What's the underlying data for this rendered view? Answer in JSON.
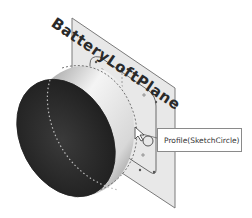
{
  "viewport": {
    "background": "#ffffff",
    "plane": {
      "label": "BatteryLoftPlane",
      "fill": "#e6e6e6",
      "edge": "#7a7a7a"
    },
    "cylinder": {
      "face_color": "#2c2c2c",
      "side_light": "#f2f2f2",
      "side_dark": "#8c8c8c"
    },
    "sketch": {
      "line_color": "#6a6a6a"
    },
    "tooltip": {
      "text": "Profile(SketchCircle)",
      "icon": "pointer-arrow-icon"
    }
  }
}
